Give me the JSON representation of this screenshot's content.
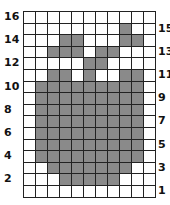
{
  "grid": {
    "columns": 11,
    "rows": 16,
    "fill_color": "#8a8a8a",
    "empty_color": "#ffffff",
    "pattern": [
      "00000000000",
      "00000000100",
      "00011000110",
      "00111011000",
      "00000110000",
      "00110100110",
      "01111111110",
      "01111111110",
      "01111111110",
      "01111111110",
      "01111111110",
      "01111111110",
      "01111111110",
      "00111111100",
      "00011111000",
      "00000000000"
    ]
  },
  "labels": {
    "left": [
      {
        "row": 1,
        "text": "16"
      },
      {
        "row": 3,
        "text": "14"
      },
      {
        "row": 5,
        "text": "12"
      },
      {
        "row": 7,
        "text": "10"
      },
      {
        "row": 9,
        "text": "8"
      },
      {
        "row": 11,
        "text": "6"
      },
      {
        "row": 13,
        "text": "4"
      },
      {
        "row": 15,
        "text": "2"
      }
    ],
    "right": [
      {
        "row": 2,
        "text": "15"
      },
      {
        "row": 4,
        "text": "13"
      },
      {
        "row": 6,
        "text": "11"
      },
      {
        "row": 8,
        "text": "9"
      },
      {
        "row": 10,
        "text": "7"
      },
      {
        "row": 12,
        "text": "5"
      },
      {
        "row": 14,
        "text": "3"
      },
      {
        "row": 16,
        "text": "1"
      }
    ]
  }
}
